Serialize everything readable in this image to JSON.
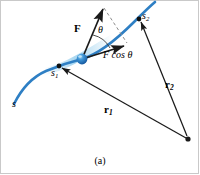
{
  "figure": {
    "caption": "(a)",
    "colors": {
      "path": "#2E7FC4",
      "path_highlight": "#7FC2E8",
      "particle": "#1A6FBF",
      "vector": "#1A1A1A",
      "dashed": "#8C8C8C",
      "frame": "#C9C9C9",
      "background": "#FFFFFF"
    },
    "labels": {
      "force_vector": "F",
      "angle": "θ",
      "force_component": "F cos θ",
      "force_component_symbol": "F",
      "force_component_text": "cos",
      "force_component_angle": "θ",
      "path_start": "s",
      "path_point_1_symbol": "s",
      "path_point_1_sub": "1",
      "path_point_2_symbol": "s",
      "path_point_2_sub": "2",
      "position_vector_1_symbol": "r",
      "position_vector_1_sub": "1",
      "position_vector_2_symbol": "r",
      "position_vector_2_sub": "2"
    },
    "elements": {
      "path_curve_name": "particle-path-curve",
      "particle_name": "particle-marker",
      "force_arrow_name": "force-vector-arrow",
      "component_arrow_name": "force-component-arrow",
      "angle_arc_name": "angle-arc",
      "dashed_projection_name": "projection-dashed-line",
      "r1_arrow_name": "position-vector-r1-arrow",
      "r2_arrow_name": "position-vector-r2-arrow",
      "origin_name": "origin-point"
    },
    "geometry": {
      "origin": [
        188,
        139
      ],
      "particle": [
        82,
        59
      ],
      "s1_point": [
        59,
        66
      ],
      "s2_point": [
        139,
        19
      ],
      "force_tip": [
        104,
        6
      ],
      "component_tip": [
        126,
        45
      ]
    }
  }
}
